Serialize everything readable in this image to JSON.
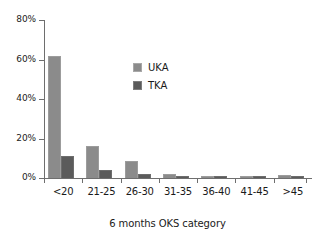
{
  "chart_data": {
    "type": "bar",
    "title": "",
    "xlabel": "6 months OKS category",
    "ylabel": "",
    "categories": [
      "<20",
      "21-25",
      "26-30",
      "31-35",
      "36-40",
      "41-45",
      ">45"
    ],
    "series": [
      {
        "name": "UKA",
        "color": "#8b8b8b",
        "values": [
          62,
          16,
          8.5,
          2,
          1,
          1,
          1.5
        ]
      },
      {
        "name": "TKA",
        "color": "#5b5b5b",
        "values": [
          11,
          4,
          2,
          1,
          0.4,
          0.4,
          0.4
        ]
      }
    ],
    "ylim": [
      0,
      80
    ],
    "ytick_values": [
      0,
      20,
      40,
      60,
      80
    ],
    "ytick_labels": [
      "0%",
      "20%",
      "40%",
      "60%",
      "80%"
    ],
    "grid": false,
    "legend_position": "inside-upper-center"
  },
  "axes": {
    "y": {
      "ticks": [
        {
          "label": "80%",
          "value": 80
        },
        {
          "label": "60%",
          "value": 60
        },
        {
          "label": "40%",
          "value": 40
        },
        {
          "label": "20%",
          "value": 20
        },
        {
          "label": "0%",
          "value": 0
        }
      ]
    },
    "x": {
      "title": "6 months OKS category",
      "categories": [
        "<20",
        "21-25",
        "26-30",
        "31-35",
        "36-40",
        "41-45",
        ">45"
      ]
    }
  },
  "legend": {
    "items": [
      {
        "label": "UKA",
        "color": "#8b8b8b"
      },
      {
        "label": "TKA",
        "color": "#5b5b5b"
      }
    ]
  }
}
